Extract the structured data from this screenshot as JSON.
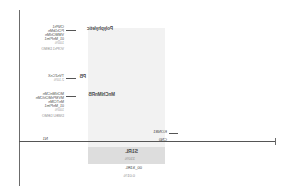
{
  "figure": {
    "type": "branch-diagram",
    "background": "#ffffff",
    "band_color": "#f2f2f2",
    "highlight_color": "#dddddd",
    "axis_color": "#555555",
    "text_color": "#4a4a4a",
    "muted_text_color": "#9a9a9a"
  },
  "axis": {
    "baseline_label_left": "CN0",
    "baseline_label_right": "N1"
  },
  "nodes": [
    {
      "id": "node-top",
      "name": "Polyphyletic",
      "lines": [
        "CNPh1",
        "PCh1bMn",
        "VMMChIMn",
        "01_MnPIm1",
        "VOPh1 DEMO"
      ],
      "percent": "100%"
    },
    {
      "id": "node-pb",
      "name": "PB",
      "lines": [
        "TVnZCnX"
      ],
      "percent": "2.10%"
    },
    {
      "id": "node-monophyletic",
      "name": "MnChIMnRB",
      "lines": [
        "MChIMnCMn",
        "MVSPhMChICMn",
        "MnTCIMn",
        "01_MnPIm1",
        "DWEU DEMO"
      ],
      "percent": "100%"
    }
  ],
  "branch_labels": [
    {
      "id": "branch-1",
      "text": "KONB1"
    },
    {
      "id": "branch-2",
      "text": "CN0"
    }
  ],
  "highlight": {
    "title": "S1RL",
    "subtitle": "110%",
    "line3": "00_S1RL",
    "line4": "0.01%"
  }
}
